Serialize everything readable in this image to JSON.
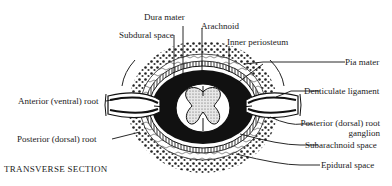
{
  "diagram": {
    "title": "TRANSVERSE SECTION",
    "labels": {
      "dura_mater": "Dura mater",
      "subdural_space": "Subdural space",
      "arachnoid": "Arachnoid",
      "inner_periosteum": "Inner periosteum",
      "pia_mater": "Pia mater",
      "denticulate_ligament": "Denticulate ligament",
      "posterior_root_ganglion_line1": "Posterior (dorsal) root",
      "posterior_root_ganglion_line2": "ganglion",
      "subarachnoid_space": "Subarachnoid space",
      "epidural_space": "Epidural space",
      "anterior_root": "Anterior (ventral) root",
      "posterior_root": "Posterior (dorsal) root"
    },
    "colors": {
      "ink": "#1a1a1a",
      "background": "#ffffff",
      "grey_matter_fill": "#cfcfcf"
    }
  }
}
